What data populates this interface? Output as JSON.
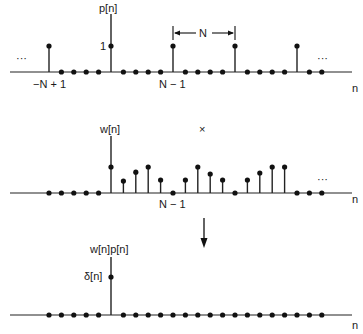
{
  "figure": {
    "panels": [
      {
        "id": "p",
        "label": "p[n]",
        "axis_label": "n",
        "unit_label": "1",
        "left_label": "−N + 1",
        "right_label": "N − 1",
        "period_label": "N",
        "ellipsis_left": "···",
        "ellipsis_right": "···"
      },
      {
        "id": "w",
        "label": "w[n]",
        "axis_label": "n",
        "right_label": "N − 1",
        "ellipsis_right": "···"
      },
      {
        "id": "wp",
        "label": "w[n]p[n]",
        "axis_label": "n",
        "delta_label": "δ[n]"
      }
    ],
    "multiply_symbol": "×",
    "arrow": "down-arrow"
  },
  "chart_data": [
    {
      "type": "stem",
      "title": "p[n]",
      "xlabel": "n",
      "n": [
        -5,
        -4,
        -3,
        -2,
        -1,
        0,
        1,
        2,
        3,
        4,
        5,
        6,
        7,
        8,
        9,
        10,
        11,
        12,
        13,
        14,
        15,
        16,
        17
      ],
      "values": [
        1,
        0,
        0,
        0,
        0,
        1,
        0,
        0,
        0,
        0,
        1,
        0,
        0,
        0,
        0,
        1,
        0,
        0,
        0,
        0,
        1,
        0,
        0
      ],
      "period": 5,
      "annotations": [
        "−N + 1",
        "N − 1",
        "N",
        "1"
      ]
    },
    {
      "type": "stem",
      "title": "w[n]",
      "xlabel": "n",
      "n": [
        -5,
        -4,
        -3,
        -2,
        -1,
        0,
        1,
        2,
        3,
        4,
        5,
        6,
        7,
        8,
        9,
        10,
        11,
        12,
        13,
        14,
        15,
        16,
        17
      ],
      "values": [
        0,
        0,
        0,
        0,
        0,
        1.0,
        0.46,
        0.8,
        1.0,
        0.5,
        0,
        0.5,
        1.0,
        0.73,
        0.5,
        0,
        0.5,
        0.77,
        1.0,
        1.0,
        0,
        0,
        0
      ],
      "annotations": [
        "N − 1"
      ]
    },
    {
      "type": "stem",
      "title": "w[n]p[n]",
      "xlabel": "n",
      "n": [
        -5,
        -4,
        -3,
        -2,
        -1,
        0,
        1,
        2,
        3,
        4,
        5,
        6,
        7,
        8,
        9,
        10,
        11,
        12,
        13,
        14,
        15,
        16,
        17
      ],
      "values": [
        0,
        0,
        0,
        0,
        0,
        1,
        0,
        0,
        0,
        0,
        0,
        0,
        0,
        0,
        0,
        0,
        0,
        0,
        0,
        0,
        0,
        0,
        0
      ],
      "annotations": [
        "δ[n]"
      ]
    }
  ]
}
